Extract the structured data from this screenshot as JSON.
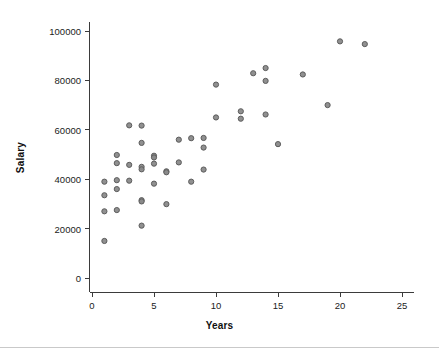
{
  "chart_data": {
    "type": "scatter",
    "title": "",
    "xlabel": "Years",
    "ylabel": "Salary",
    "xlim": [
      -1,
      26
    ],
    "ylim": [
      -4000,
      104000
    ],
    "grid": false,
    "legend": null,
    "xticks": [
      0,
      5,
      10,
      15,
      20,
      25
    ],
    "xtick_labels": [
      "0",
      "5",
      "10",
      "15",
      "20",
      "25"
    ],
    "yticks": [
      0,
      20000,
      40000,
      60000,
      80000,
      100000
    ],
    "ytick_labels": [
      "0",
      "20000",
      "40000",
      "60000",
      "80000",
      "100000"
    ],
    "marker": "circle-open-gray",
    "point_color": "#8a8a8a",
    "point_edge_color": "#5d5d5d",
    "axis_color": "#3b3b3b",
    "background": "#ffffff",
    "n_points": 50,
    "points": [
      {
        "x": 1,
        "y": 39000
      },
      {
        "x": 1,
        "y": 33500
      },
      {
        "x": 1,
        "y": 27000
      },
      {
        "x": 1,
        "y": 15000
      },
      {
        "x": 2,
        "y": 49800
      },
      {
        "x": 2,
        "y": 46500
      },
      {
        "x": 2,
        "y": 39600
      },
      {
        "x": 2,
        "y": 36000
      },
      {
        "x": 2,
        "y": 27500
      },
      {
        "x": 3,
        "y": 61800
      },
      {
        "x": 3,
        "y": 45800
      },
      {
        "x": 3,
        "y": 39400
      },
      {
        "x": 4,
        "y": 61700
      },
      {
        "x": 4,
        "y": 54700
      },
      {
        "x": 4,
        "y": 45000
      },
      {
        "x": 4,
        "y": 44000
      },
      {
        "x": 4,
        "y": 31500
      },
      {
        "x": 4,
        "y": 31000
      },
      {
        "x": 4,
        "y": 21200
      },
      {
        "x": 5,
        "y": 49500
      },
      {
        "x": 5,
        "y": 48800
      },
      {
        "x": 5,
        "y": 46300
      },
      {
        "x": 5,
        "y": 38200
      },
      {
        "x": 6,
        "y": 43200
      },
      {
        "x": 6,
        "y": 42800
      },
      {
        "x": 6,
        "y": 29900
      },
      {
        "x": 7,
        "y": 56000
      },
      {
        "x": 7,
        "y": 46800
      },
      {
        "x": 8,
        "y": 56600
      },
      {
        "x": 8,
        "y": 39000
      },
      {
        "x": 9,
        "y": 56700
      },
      {
        "x": 9,
        "y": 52800
      },
      {
        "x": 9,
        "y": 43900
      },
      {
        "x": 10,
        "y": 78300
      },
      {
        "x": 10,
        "y": 65000
      },
      {
        "x": 12,
        "y": 67500
      },
      {
        "x": 12,
        "y": 64500
      },
      {
        "x": 13,
        "y": 82900
      },
      {
        "x": 14,
        "y": 85000
      },
      {
        "x": 14,
        "y": 79800
      },
      {
        "x": 14,
        "y": 66200
      },
      {
        "x": 15,
        "y": 54200
      },
      {
        "x": 17,
        "y": 82400
      },
      {
        "x": 19,
        "y": 70000
      },
      {
        "x": 20,
        "y": 95800
      },
      {
        "x": 22,
        "y": 94700
      }
    ]
  },
  "plot_area": {
    "x0_px": 92,
    "y0_px": 278,
    "px_per_year": 12.4,
    "px_per_salary": 0.00247,
    "axis_top_px": 22,
    "axis_right_px": 412
  }
}
